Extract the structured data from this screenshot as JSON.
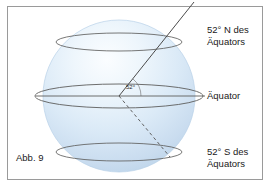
{
  "figure": {
    "caption": "Abb. 9",
    "angle_label": "52°",
    "labels": {
      "north": "52° N des\nÄquators",
      "equator": "Äquator",
      "south": "52° S des\nÄquators"
    },
    "colors": {
      "frame_border": "#9a9a9a",
      "background": "#ffffff",
      "sphere_light": "#f4f9fd",
      "sphere_mid": "#dceaf7",
      "sphere_dark": "#c3d9ee",
      "outline": "#5b5b5b",
      "text": "#1a1a1a"
    },
    "geometry": {
      "sphere_center_x": 119,
      "sphere_center_y": 96,
      "sphere_radius": 76,
      "equator_ellipse_rx": 84,
      "equator_ellipse_ry": 12,
      "north_circle_y": 42,
      "north_circle_rx": 63,
      "north_circle_ry": 9,
      "south_circle_y": 152,
      "south_circle_rx": 63,
      "south_circle_ry": 9,
      "ray_end_x": 194,
      "ray_end_y": 2,
      "dashed_end_x": 170,
      "dashed_end_y": 157
    }
  }
}
